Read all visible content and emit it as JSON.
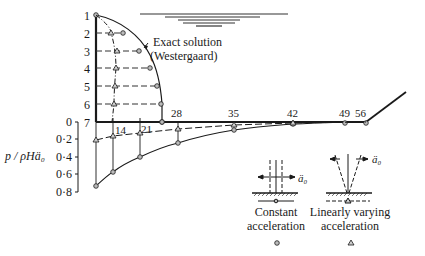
{
  "annotation": {
    "exact_solution_line1": "Exact solution",
    "exact_solution_line2": "(Westergaard)"
  },
  "wall_nodes": [
    {
      "label": "1",
      "y": 15
    },
    {
      "label": "2",
      "y": 33
    },
    {
      "label": "3",
      "y": 51
    },
    {
      "label": "4",
      "y": 68
    },
    {
      "label": "5",
      "y": 86
    },
    {
      "label": "6",
      "y": 104
    },
    {
      "label": "7",
      "y": 122
    }
  ],
  "base_nodes": [
    {
      "label": "14",
      "x": 113
    },
    {
      "label": "21",
      "x": 140
    },
    {
      "label": "28",
      "x": 178
    },
    {
      "label": "35",
      "x": 234
    },
    {
      "label": "42",
      "x": 293
    },
    {
      "label": "49",
      "x": 345
    },
    {
      "label": "56",
      "x": 366
    }
  ],
  "pressure_axis": {
    "label": "p / ρHä₀",
    "ticks": [
      "0",
      "0·2",
      "0·4",
      "0·6",
      "0·8"
    ]
  },
  "legend": {
    "constant": {
      "line1": "Constant",
      "line2": "acceleration",
      "symbol": "circle-marker"
    },
    "linear": {
      "line1": "Linearly varying",
      "line2": "acceleration",
      "symbol": "triangle-marker"
    },
    "accel_label": "ä₀"
  },
  "colors": {
    "ink": "#1a1a1a",
    "background": "#ffffff"
  }
}
